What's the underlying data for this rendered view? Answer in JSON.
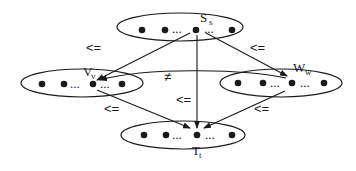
{
  "diagram": {
    "nodes": [
      {
        "id": "S",
        "label": "S",
        "subscript": "s"
      },
      {
        "id": "V",
        "label": "V",
        "subscript": "v"
      },
      {
        "id": "W",
        "label": "W",
        "subscript": "w"
      },
      {
        "id": "T",
        "label": "T",
        "subscript": "t"
      }
    ],
    "ellipsis": "...",
    "edges": [
      {
        "from": "S",
        "to": "V",
        "label": "<="
      },
      {
        "from": "S",
        "to": "W",
        "label": "<="
      },
      {
        "from": "S",
        "to": "T",
        "label": "<="
      },
      {
        "from": "V",
        "to": "T",
        "label": "<="
      },
      {
        "from": "W",
        "to": "T",
        "label": "<="
      },
      {
        "from": "W",
        "to": "V",
        "label": "≠"
      }
    ]
  }
}
